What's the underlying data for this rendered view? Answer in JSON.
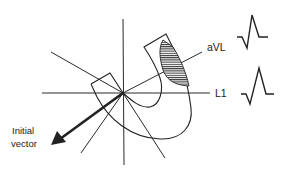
{
  "diagram": {
    "type": "ECG frontal-plane lead axes with heart outline and initial depolarization vector",
    "leads": [
      {
        "name": "L1",
        "label": "L1",
        "waveform": "small q, tall R, return to baseline"
      },
      {
        "name": "aVL",
        "label": "aVL",
        "waveform": "small q, tall R, return to baseline"
      }
    ],
    "vector": {
      "label_line1": "Initial",
      "label_line2": "vector"
    },
    "shaded_region": "infarct/septal region hatched in heart wall",
    "colors": {
      "line": "#222222",
      "background": "#ffffff"
    }
  }
}
